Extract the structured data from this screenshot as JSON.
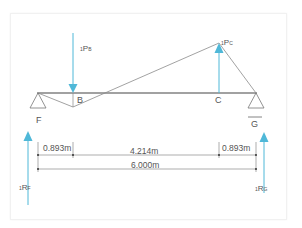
{
  "diagram": {
    "type": "beam influence diagram",
    "points": {
      "F": {
        "label": "F"
      },
      "B": {
        "label": "B"
      },
      "C": {
        "label": "C"
      },
      "G": {
        "label": "G"
      }
    },
    "loads": {
      "PB": {
        "prefix": "1",
        "main": "P",
        "sub": "B",
        "direction": "down"
      },
      "PC": {
        "prefix": "1",
        "main": "P",
        "sub": "C",
        "direction": "up"
      }
    },
    "reactions": {
      "RF": {
        "prefix": "1",
        "main": "R",
        "sub": "F",
        "direction": "up"
      },
      "RG": {
        "prefix": "1",
        "main": "R",
        "sub": "G",
        "direction": "up"
      }
    },
    "dimensions": {
      "left_segment": "0.893m",
      "middle_segment": "4.214m",
      "right_segment": "0.893m",
      "total": "6.000m"
    },
    "colors": {
      "arrow": "#4fb8d8",
      "beam": "#444444",
      "line": "#888888",
      "text": "#555555",
      "frame": "#f1f1f1"
    }
  }
}
